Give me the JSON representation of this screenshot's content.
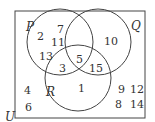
{
  "diagram": {
    "type": "venn",
    "universe_label": "U",
    "sets": [
      {
        "label": "P",
        "cx": 60,
        "cy": 42,
        "r": 33
      },
      {
        "label": "Q",
        "cx": 98,
        "cy": 42,
        "r": 33
      },
      {
        "label": "R",
        "cx": 78,
        "cy": 78,
        "r": 33
      }
    ],
    "regions": {
      "P_only": [
        "2",
        "7",
        "11",
        "13"
      ],
      "Q_only": [
        "10"
      ],
      "R_only": [
        "1"
      ],
      "P_and_Q_only": [
        "5"
      ],
      "P_and_R_only": [
        "3"
      ],
      "Q_and_R_only": [
        "15"
      ],
      "P_Q_R": [],
      "outside": [
        "4",
        "6",
        "8",
        "9",
        "12",
        "14"
      ]
    },
    "labels": {
      "P": "P",
      "Q": "Q",
      "R": "R",
      "U": "U",
      "n2": "2",
      "n7": "7",
      "n11": "11",
      "n13": "13",
      "n10": "10",
      "n1": "1",
      "n5": "5",
      "n3": "3",
      "n15": "15",
      "n4": "4",
      "n6": "6",
      "n9": "9",
      "n12": "12",
      "n8": "8",
      "n14": "14"
    }
  }
}
